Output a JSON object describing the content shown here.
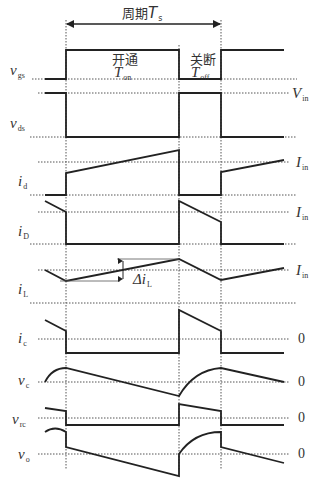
{
  "diagram": {
    "period_label": {
      "prefix": "周期",
      "symbol": "T",
      "subscript": "s"
    },
    "on_label": {
      "text": "开通",
      "symbol": "T",
      "subscript": "on"
    },
    "off_label": {
      "text": "关断",
      "symbol": "T",
      "subscript": "off"
    },
    "delta_label": {
      "symbol": "Δi",
      "subscript": "L"
    },
    "signals": [
      {
        "id": "vgs",
        "symbol": "v",
        "subscript": "gs",
        "right_ref": null
      },
      {
        "id": "vds",
        "symbol": "v",
        "subscript": "ds",
        "right_ref": {
          "symbol": "V",
          "subscript": "in"
        }
      },
      {
        "id": "id",
        "symbol": "i",
        "subscript": "d",
        "right_ref": {
          "symbol": "I",
          "subscript": "in"
        }
      },
      {
        "id": "iD",
        "symbol": "i",
        "subscript": "D",
        "right_ref": {
          "symbol": "I",
          "subscript": "in"
        }
      },
      {
        "id": "iL",
        "symbol": "i",
        "subscript": "L",
        "right_ref": {
          "symbol": "I",
          "subscript": "in"
        }
      },
      {
        "id": "ic",
        "symbol": "i",
        "subscript": "c",
        "right_ref": {
          "text": "0"
        }
      },
      {
        "id": "vc",
        "symbol": "v",
        "subscript": "c",
        "right_ref": {
          "text": "0"
        }
      },
      {
        "id": "vrc",
        "symbol": "v",
        "subscript": "rc",
        "right_ref": {
          "text": "0"
        }
      },
      {
        "id": "vo",
        "symbol": "v",
        "subscript": "o",
        "right_ref": {
          "text": "0"
        }
      }
    ],
    "caption": ""
  },
  "colors": {
    "waveform": "#222222",
    "dotted": "#555555",
    "text": "#333333",
    "background": "#ffffff"
  }
}
